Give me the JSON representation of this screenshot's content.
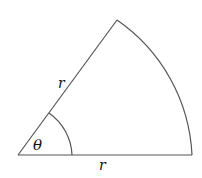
{
  "diagram": {
    "labels": {
      "radius_slant": "r",
      "radius_base": "r",
      "angle": "θ"
    },
    "colors": {
      "stroke": "#555555",
      "text": "#111111",
      "background": "#ffffff"
    }
  }
}
